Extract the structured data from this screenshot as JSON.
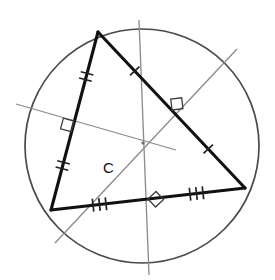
{
  "figure": {
    "kind": "circumcenter-construction",
    "label": "C",
    "label_pos": {
      "x": 103,
      "y": 173
    },
    "canvas": {
      "width": 275,
      "height": 280
    },
    "colors": {
      "background": "#ffffff",
      "circle": "#4a4a4a",
      "triangle": "#111111",
      "bisector": "#8a8a8a",
      "tick": "#222222",
      "right_angle": "#3c3c3c"
    },
    "circle": {
      "cx": 142,
      "cy": 146,
      "r": 117
    },
    "circumcenter": {
      "x": 143,
      "y": 143
    },
    "vertices": [
      {
        "name": "apex",
        "x": 98,
        "y": 32
      },
      {
        "name": "bottom-left",
        "x": 51,
        "y": 210
      },
      {
        "name": "right",
        "x": 245,
        "y": 188
      }
    ],
    "sides": [
      {
        "name": "left-side",
        "from": [
          98,
          32
        ],
        "to": [
          51,
          210
        ],
        "ticks_per_half": 2
      },
      {
        "name": "bottom-side",
        "from": [
          51,
          210
        ],
        "to": [
          245,
          188
        ],
        "ticks_per_half": 3
      },
      {
        "name": "hypotenuse",
        "from": [
          98,
          32
        ],
        "to": [
          245,
          188
        ],
        "ticks_per_half": 1
      }
    ],
    "perpendicular_bisectors": [
      {
        "name": "bisector-left-side",
        "from": [
          16,
          104
        ],
        "to": [
          176,
          150
        ]
      },
      {
        "name": "bisector-bottom-side",
        "from": [
          149,
          275
        ],
        "to": [
          139,
          20
        ]
      },
      {
        "name": "bisector-hypotenuse",
        "from": [
          237,
          49
        ],
        "to": [
          55,
          243
        ]
      }
    ],
    "right_angle_marks": [
      {
        "name": "right-angle-left-side",
        "x": 74,
        "y": 121
      },
      {
        "name": "right-angle-hypotenuse",
        "x": 172,
        "y": 110
      },
      {
        "name": "right-angle-bottom-side",
        "x": 148,
        "y": 199
      }
    ]
  }
}
